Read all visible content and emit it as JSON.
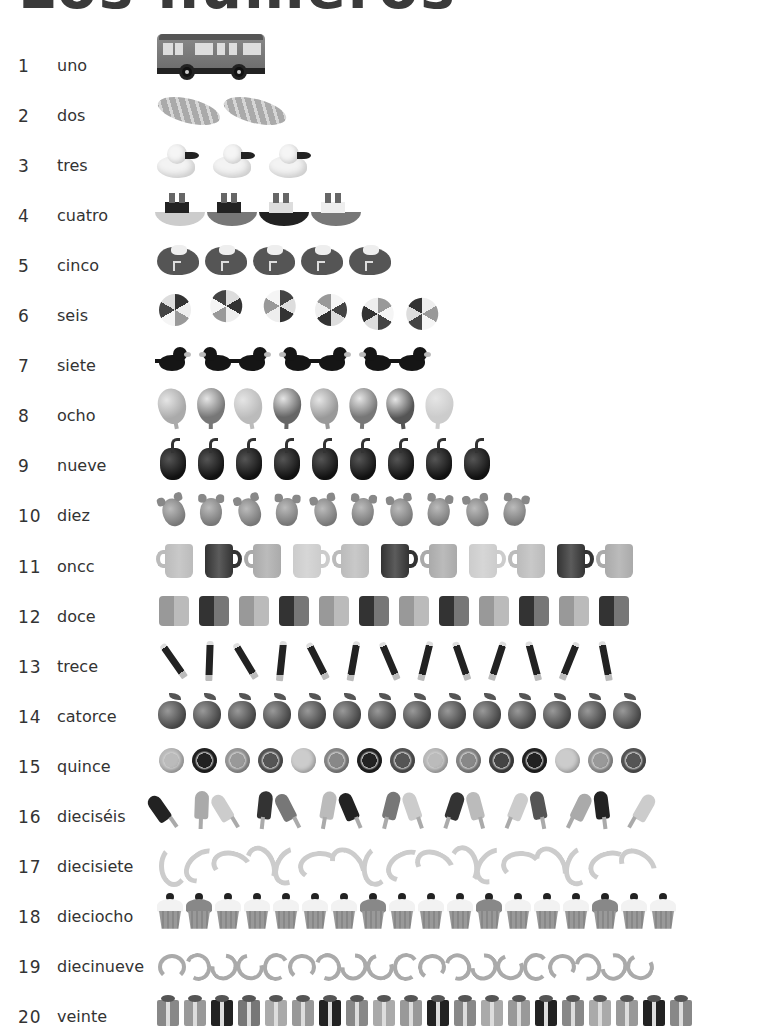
{
  "page": {
    "title": "Los números"
  },
  "rows": [
    {
      "num": "1",
      "word": "uno",
      "count": 1,
      "object": "bus"
    },
    {
      "num": "2",
      "word": "dos",
      "count": 2,
      "object": "bread"
    },
    {
      "num": "3",
      "word": "tres",
      "count": 3,
      "object": "duck"
    },
    {
      "num": "4",
      "word": "cuatro",
      "count": 4,
      "object": "boat"
    },
    {
      "num": "5",
      "word": "cinco",
      "count": 5,
      "object": "shoe"
    },
    {
      "num": "6",
      "word": "seis",
      "count": 6,
      "object": "beach-ball"
    },
    {
      "num": "7",
      "word": "siete",
      "count": 7,
      "object": "bird"
    },
    {
      "num": "8",
      "word": "ocho",
      "count": 8,
      "object": "balloon"
    },
    {
      "num": "9",
      "word": "nueve",
      "count": 9,
      "object": "pepper"
    },
    {
      "num": "10",
      "word": "diez",
      "count": 10,
      "object": "mouse"
    },
    {
      "num": "11",
      "word": "oncc",
      "count": 11,
      "object": "mug"
    },
    {
      "num": "12",
      "word": "doce",
      "count": 12,
      "object": "block"
    },
    {
      "num": "13",
      "word": "trece",
      "count": 13,
      "object": "pencil"
    },
    {
      "num": "14",
      "word": "catorce",
      "count": 14,
      "object": "apple"
    },
    {
      "num": "15",
      "word": "quince",
      "count": 15,
      "object": "button"
    },
    {
      "num": "16",
      "word": "dieciséis",
      "count": 16,
      "object": "popsicle"
    },
    {
      "num": "17",
      "word": "diecisiete",
      "count": 17,
      "object": "banana"
    },
    {
      "num": "18",
      "word": "dieciocho",
      "count": 18,
      "object": "cupcake"
    },
    {
      "num": "19",
      "word": "diecinueve",
      "count": 19,
      "object": "worm"
    },
    {
      "num": "20",
      "word": "veinte",
      "count": 20,
      "object": "gift"
    }
  ],
  "colors": {
    "text": "#333333",
    "background": "#ffffff"
  }
}
